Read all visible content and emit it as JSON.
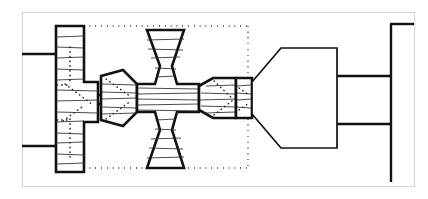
{
  "figure": {
    "canvas": {
      "width": 428,
      "height": 199
    },
    "background_color": "#ffffff",
    "line_color": "#111111",
    "hatch_color": "#2a2a2a",
    "frame_color": "#d4d4d4"
  },
  "frame": {
    "name": "figure-border",
    "x": 22,
    "y": 12,
    "width": 393,
    "height": 175
  },
  "dotted_region": {
    "name": "section-boundary",
    "x": 78,
    "y": 26,
    "width": 170,
    "height": 142,
    "style": "dotted"
  },
  "components": [
    {
      "id": "left-flange-plate",
      "label": "left-flange-plate",
      "shape": "stepped-vertical-plate",
      "hatched": true,
      "points": "56,26 84,26 84,82 98,82 98,122 84,122 84,172 56,172",
      "hatch_count": 14
    },
    {
      "id": "upper-input-shaft",
      "label": "upper-input-shaft",
      "shape": "horizontal-line",
      "x1": 22,
      "y1": 54,
      "x2": 57,
      "y2": 54
    },
    {
      "id": "lower-input-shaft",
      "label": "lower-input-shaft",
      "shape": "horizontal-line",
      "x1": 22,
      "y1": 146,
      "x2": 57,
      "y2": 146
    },
    {
      "id": "coupling-block",
      "label": "coupling-block",
      "shape": "tapered-block",
      "hatched": true,
      "points": "99,76 123,70 137,84 137,112 123,126 99,120",
      "hatch_count": 7
    },
    {
      "id": "central-cross-hub",
      "label": "central-cross-hub",
      "shape": "cross-plus-hub",
      "hatched": true,
      "points": "137,84 155,84 160,66 147,30 184,30 172,66 177,84 199,84 199,112 177,112 172,130 184,168 147,168 160,130 155,112 137,112",
      "hatch_count": 22
    },
    {
      "id": "right-taper-block",
      "label": "right-taper-block",
      "shape": "hexagonal-taper-block",
      "hatched": true,
      "points": "199,86 213,78 236,78 236,118 213,118 199,110",
      "hatch_count": 6
    },
    {
      "id": "seal-collar",
      "label": "seal-collar",
      "shape": "rectangular-collar",
      "hatched": true,
      "points": "236,78 252,78 252,118 236,118",
      "hatch_count": 5
    },
    {
      "id": "output-cone-body",
      "label": "output-cone-body",
      "shape": "cone-with-flat-back",
      "points": "252,82 281,48 337,48 337,148 281,148 252,114"
    },
    {
      "id": "output-shaft-upper",
      "label": "output-shaft-upper-edge",
      "shape": "horizontal-line",
      "x1": 337,
      "y1": 76,
      "x2": 391,
      "y2": 76
    },
    {
      "id": "output-shaft-lower",
      "label": "output-shaft-lower-edge",
      "shape": "horizontal-line",
      "x1": 337,
      "y1": 124,
      "x2": 391,
      "y2": 124
    },
    {
      "id": "end-stop-wall",
      "label": "end-stop-wall",
      "shape": "vertical-line",
      "x1": 391,
      "y1": 24,
      "x2": 391,
      "y2": 182
    },
    {
      "id": "end-cap-top",
      "label": "end-cap-top-edge",
      "shape": "horizontal-line",
      "x1": 391,
      "y1": 24,
      "x2": 414,
      "y2": 24
    }
  ],
  "hidden_detail_lines": [
    {
      "id": "left-plate-bore-upper",
      "label": "left-plate-hidden-bore-upper",
      "x1": 70,
      "y1": 48,
      "x2": 70,
      "y2": 82
    },
    {
      "id": "left-plate-bore-lower",
      "label": "left-plate-hidden-bore-lower",
      "x1": 70,
      "y1": 120,
      "x2": 70,
      "y2": 158
    },
    {
      "id": "left-plate-diagonal",
      "label": "left-plate-hidden-chamfer",
      "x1": 66,
      "y1": 84,
      "x2": 92,
      "y2": 104
    },
    {
      "id": "left-plate-diagonal-2",
      "label": "left-plate-hidden-chamfer-lower",
      "x1": 66,
      "y1": 120,
      "x2": 80,
      "y2": 108
    },
    {
      "id": "coupling-hidden-upper",
      "label": "coupling-hidden-edge-upper",
      "x1": 106,
      "y1": 80,
      "x2": 130,
      "y2": 96
    },
    {
      "id": "coupling-hidden-lower",
      "label": "coupling-hidden-edge-lower",
      "x1": 106,
      "y1": 118,
      "x2": 130,
      "y2": 100
    },
    {
      "id": "collar-hidden-arc",
      "label": "seal-collar-hidden-arc",
      "x1": 214,
      "y1": 82,
      "x2": 232,
      "y2": 98
    },
    {
      "id": "collar-hidden-arc-2",
      "label": "seal-collar-hidden-arc-lower",
      "x1": 214,
      "y1": 114,
      "x2": 232,
      "y2": 100
    }
  ]
}
